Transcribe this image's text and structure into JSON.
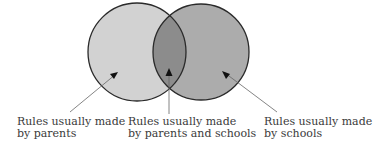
{
  "diagram": {
    "type": "venn",
    "sets": [
      {
        "name": "parents",
        "color": "#cfcfcf"
      },
      {
        "name": "schools",
        "color": "#a9a9a9"
      }
    ],
    "overlap_color": "#8a8a8a",
    "labels": {
      "left": {
        "line1": "Rules usually made",
        "line2": "by parents"
      },
      "middle": {
        "line1": "Rules usually made",
        "line2": "by parents and schools"
      },
      "right": {
        "line1": "Rules usually made",
        "line2": "by schools"
      }
    }
  }
}
